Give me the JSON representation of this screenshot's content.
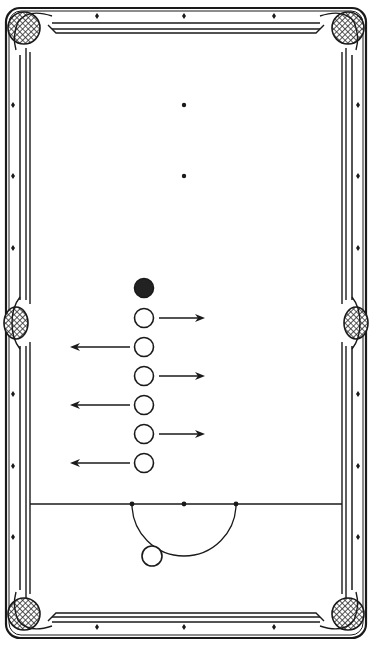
{
  "diagram": {
    "type": "snooker-pool-table-drill",
    "colors": {
      "ink": "#1a1a1a",
      "background": "#ffffff",
      "pocket_mesh": "#3a3a3a"
    },
    "table": {
      "outer": [
        6,
        8,
        366,
        638
      ],
      "cushion_inner": [
        30,
        33,
        342,
        613
      ]
    },
    "pockets": [
      {
        "name": "top-left",
        "x": 24,
        "y": 28
      },
      {
        "name": "top-right",
        "x": 348,
        "y": 28
      },
      {
        "name": "middle-left",
        "x": 16,
        "y": 323
      },
      {
        "name": "middle-right",
        "x": 356,
        "y": 323
      },
      {
        "name": "bottom-left",
        "x": 24,
        "y": 614
      },
      {
        "name": "bottom-right",
        "x": 348,
        "y": 614
      }
    ],
    "diamonds": {
      "top": [
        [
          97,
          16
        ],
        [
          184,
          16
        ],
        [
          274,
          16
        ]
      ],
      "bottom": [
        [
          97,
          627
        ],
        [
          184,
          627
        ],
        [
          274,
          627
        ]
      ],
      "left": [
        [
          13,
          105
        ],
        [
          13,
          176
        ],
        [
          13,
          248
        ],
        [
          13,
          394
        ],
        [
          13,
          466
        ],
        [
          13,
          537
        ]
      ],
      "right": [
        [
          358,
          105
        ],
        [
          358,
          176
        ],
        [
          358,
          248
        ],
        [
          358,
          394
        ],
        [
          358,
          466
        ],
        [
          358,
          537
        ]
      ]
    },
    "spots": [
      [
        184,
        105
      ],
      [
        184,
        176
      ]
    ],
    "balls": [
      {
        "label": "black-ball",
        "x": 144,
        "y": 288,
        "filled": true
      },
      {
        "label": "object-ball-1",
        "x": 144,
        "y": 318,
        "filled": false,
        "arrow": "right"
      },
      {
        "label": "object-ball-2",
        "x": 144,
        "y": 347,
        "filled": false,
        "arrow": "left"
      },
      {
        "label": "object-ball-3",
        "x": 144,
        "y": 376,
        "filled": false,
        "arrow": "right"
      },
      {
        "label": "object-ball-4",
        "x": 144,
        "y": 405,
        "filled": false,
        "arrow": "left"
      },
      {
        "label": "object-ball-5",
        "x": 144,
        "y": 434,
        "filled": false,
        "arrow": "right"
      },
      {
        "label": "object-ball-6",
        "x": 144,
        "y": 463,
        "filled": false,
        "arrow": "left"
      }
    ],
    "arrows": {
      "right": {
        "x1": 159,
        "x2": 205
      },
      "left": {
        "x1": 130,
        "x2": 70
      }
    },
    "baulk_line": {
      "y": 504,
      "x1": 30,
      "x2": 342,
      "spots": [
        [
          132,
          504
        ],
        [
          184,
          504
        ],
        [
          236,
          504
        ]
      ]
    },
    "d_arc": {
      "cx": 184,
      "cy": 504,
      "r": 52
    },
    "cue_ball": {
      "x": 152,
      "y": 556,
      "r": 10
    }
  }
}
